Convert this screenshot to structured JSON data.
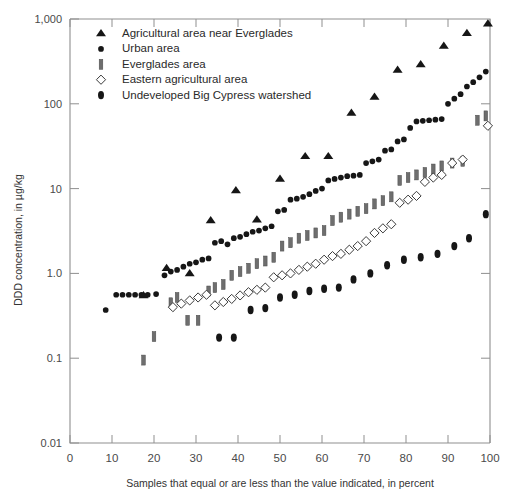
{
  "chart_data": {
    "type": "scatter",
    "title": "",
    "xlabel": "Samples that equal or are less than the value indicated, in percent",
    "ylabel": "DDD concentration, in µg/kg",
    "xlim": [
      0,
      100
    ],
    "ylim": [
      0.01,
      1000
    ],
    "yscale": "log",
    "grid": false,
    "legend_position": "upper-left-inside",
    "xticks": [
      "0",
      "10",
      "20",
      "30",
      "40",
      "50",
      "60",
      "70",
      "80",
      "90",
      "100"
    ],
    "xtick_values": [
      0,
      10,
      20,
      30,
      40,
      50,
      60,
      70,
      80,
      90,
      100
    ],
    "yticks": [
      "1,000",
      "100",
      "10",
      "1.0",
      "0.1",
      "0.01"
    ],
    "ytick_values": [
      1000,
      100,
      10,
      1.0,
      0.1,
      0.01
    ],
    "series": [
      {
        "name": "Agricultural area near Everglades",
        "marker": "filled-triangle",
        "color": "#161616",
        "points": [
          [
            17.5,
            0.55
          ],
          [
            23.0,
            1.15
          ],
          [
            28.5,
            1.0
          ],
          [
            33.5,
            4.2
          ],
          [
            39.5,
            9.5
          ],
          [
            44.5,
            4.3
          ],
          [
            50.0,
            13.0
          ],
          [
            56.0,
            24.0
          ],
          [
            61.5,
            24.0
          ],
          [
            67.0,
            78.0
          ],
          [
            72.5,
            120.0
          ],
          [
            78.0,
            250.0
          ],
          [
            83.5,
            290.0
          ],
          [
            89.0,
            480.0
          ],
          [
            94.5,
            680.0
          ],
          [
            99.5,
            880.0
          ]
        ]
      },
      {
        "name": "Urban area",
        "marker": "filled-circle",
        "color": "#161616",
        "points": [
          [
            8.5,
            0.37
          ],
          [
            11.0,
            0.56
          ],
          [
            12.5,
            0.56
          ],
          [
            14.0,
            0.56
          ],
          [
            15.5,
            0.56
          ],
          [
            17.0,
            0.56
          ],
          [
            18.5,
            0.56
          ],
          [
            20.5,
            0.57
          ],
          [
            22.5,
            0.95
          ],
          [
            24.0,
            1.05
          ],
          [
            25.5,
            1.1
          ],
          [
            27.0,
            1.2
          ],
          [
            28.5,
            1.3
          ],
          [
            30.0,
            1.35
          ],
          [
            31.5,
            1.45
          ],
          [
            33.0,
            1.5
          ],
          [
            34.5,
            2.3
          ],
          [
            36.0,
            2.4
          ],
          [
            37.5,
            2.2
          ],
          [
            39.0,
            2.6
          ],
          [
            40.5,
            2.7
          ],
          [
            42.0,
            2.9
          ],
          [
            43.5,
            3.1
          ],
          [
            45.0,
            3.2
          ],
          [
            46.5,
            3.4
          ],
          [
            48.0,
            3.6
          ],
          [
            49.5,
            5.4
          ],
          [
            51.0,
            5.6
          ],
          [
            52.5,
            7.4
          ],
          [
            54.0,
            7.6
          ],
          [
            55.5,
            8.0
          ],
          [
            57.0,
            8.6
          ],
          [
            58.5,
            9.4
          ],
          [
            60.0,
            10.0
          ],
          [
            61.5,
            12.5
          ],
          [
            63.0,
            13.0
          ],
          [
            64.5,
            13.5
          ],
          [
            66.0,
            14.0
          ],
          [
            67.5,
            14.2
          ],
          [
            69.0,
            14.5
          ],
          [
            70.5,
            20.0
          ],
          [
            72.0,
            21.0
          ],
          [
            73.5,
            22.0
          ],
          [
            75.0,
            28.0
          ],
          [
            76.5,
            29.0
          ],
          [
            78.0,
            36.0
          ],
          [
            79.5,
            38.0
          ],
          [
            81.0,
            52.0
          ],
          [
            82.5,
            62.0
          ],
          [
            84.0,
            63.0
          ],
          [
            85.5,
            64.0
          ],
          [
            87.0,
            65.0
          ],
          [
            88.5,
            66.0
          ],
          [
            90.0,
            100.0
          ],
          [
            91.5,
            115.0
          ],
          [
            93.0,
            130.0
          ],
          [
            94.5,
            160.0
          ],
          [
            96.0,
            180.0
          ],
          [
            97.5,
            205.0
          ],
          [
            99.0,
            240.0
          ]
        ]
      },
      {
        "name": "Everglades area",
        "marker": "bar",
        "color": "#6e6e6e",
        "points": [
          [
            17.5,
            0.095
          ],
          [
            20.0,
            0.18
          ],
          [
            24.0,
            0.45
          ],
          [
            25.5,
            0.52
          ],
          [
            28.0,
            0.28
          ],
          [
            30.5,
            0.28
          ],
          [
            33.0,
            0.62
          ],
          [
            34.5,
            0.68
          ],
          [
            36.5,
            0.74
          ],
          [
            38.5,
            0.95
          ],
          [
            40.5,
            1.05
          ],
          [
            42.5,
            1.15
          ],
          [
            44.5,
            1.3
          ],
          [
            46.5,
            1.4
          ],
          [
            48.5,
            1.55
          ],
          [
            50.5,
            2.1
          ],
          [
            52.5,
            2.3
          ],
          [
            54.5,
            2.6
          ],
          [
            56.5,
            2.8
          ],
          [
            58.5,
            3.0
          ],
          [
            60.5,
            3.2
          ],
          [
            62.5,
            4.2
          ],
          [
            64.5,
            4.6
          ],
          [
            66.5,
            5.0
          ],
          [
            68.5,
            5.4
          ],
          [
            70.5,
            5.8
          ],
          [
            72.5,
            6.6
          ],
          [
            74.5,
            7.2
          ],
          [
            76.5,
            8.0
          ],
          [
            78.5,
            12.5
          ],
          [
            80.5,
            13.5
          ],
          [
            82.5,
            14.5
          ],
          [
            84.5,
            15.5
          ],
          [
            86.5,
            17.0
          ],
          [
            88.5,
            18.5
          ],
          [
            91.0,
            20.0
          ],
          [
            93.5,
            21.0
          ],
          [
            97.0,
            64.0
          ],
          [
            99.0,
            72.0
          ]
        ]
      },
      {
        "name": "Eastern agricultural area",
        "marker": "open-diamond",
        "color": "#ffffff",
        "points": [
          [
            24.5,
            0.4
          ],
          [
            26.5,
            0.44
          ],
          [
            28.5,
            0.48
          ],
          [
            30.5,
            0.52
          ],
          [
            32.5,
            0.56
          ],
          [
            34.5,
            0.42
          ],
          [
            36.5,
            0.46
          ],
          [
            38.5,
            0.5
          ],
          [
            40.5,
            0.55
          ],
          [
            42.5,
            0.6
          ],
          [
            44.5,
            0.64
          ],
          [
            46.5,
            0.68
          ],
          [
            48.5,
            0.9
          ],
          [
            50.5,
            0.95
          ],
          [
            52.5,
            1.0
          ],
          [
            54.5,
            1.1
          ],
          [
            56.5,
            1.2
          ],
          [
            58.5,
            1.3
          ],
          [
            60.5,
            1.45
          ],
          [
            62.5,
            1.6
          ],
          [
            64.5,
            1.7
          ],
          [
            66.5,
            1.9
          ],
          [
            68.5,
            2.1
          ],
          [
            70.5,
            2.4
          ],
          [
            72.5,
            3.0
          ],
          [
            74.5,
            3.4
          ],
          [
            76.5,
            3.8
          ],
          [
            78.5,
            6.8
          ],
          [
            80.5,
            7.4
          ],
          [
            82.5,
            8.2
          ],
          [
            84.5,
            12.0
          ],
          [
            86.5,
            13.5
          ],
          [
            88.5,
            14.5
          ],
          [
            91.0,
            20.0
          ],
          [
            93.5,
            22.0
          ],
          [
            99.5,
            55.0
          ]
        ]
      },
      {
        "name": "Undeveloped Big Cypress watershed",
        "marker": "filled-oval",
        "color": "#161616",
        "points": [
          [
            35.5,
            0.175
          ],
          [
            39.0,
            0.175
          ],
          [
            43.0,
            0.37
          ],
          [
            46.5,
            0.39
          ],
          [
            50.0,
            0.52
          ],
          [
            53.5,
            0.56
          ],
          [
            57.0,
            0.62
          ],
          [
            60.5,
            0.66
          ],
          [
            64.0,
            0.68
          ],
          [
            67.5,
            0.85
          ],
          [
            71.5,
            1.0
          ],
          [
            75.5,
            1.25
          ],
          [
            79.5,
            1.45
          ],
          [
            83.5,
            1.55
          ],
          [
            87.5,
            1.7
          ],
          [
            91.5,
            2.1
          ],
          [
            95.0,
            2.6
          ],
          [
            99.0,
            5.0
          ]
        ]
      }
    ]
  },
  "legend": {
    "items": [
      {
        "marker": "filled-triangle",
        "label": "Agricultural area near Everglades"
      },
      {
        "marker": "filled-circle",
        "label": "Urban area"
      },
      {
        "marker": "bar",
        "label": "Everglades area"
      },
      {
        "marker": "open-diamond",
        "label": "Eastern agricultural area"
      },
      {
        "marker": "filled-oval",
        "label": "Undeveloped Big Cypress watershed"
      }
    ]
  },
  "colors": {
    "marker_dark": "#161616",
    "marker_gray": "#6e6e6e",
    "axis": "#8f8f8f",
    "text": "#1a1a1a",
    "background": "#ffffff"
  }
}
